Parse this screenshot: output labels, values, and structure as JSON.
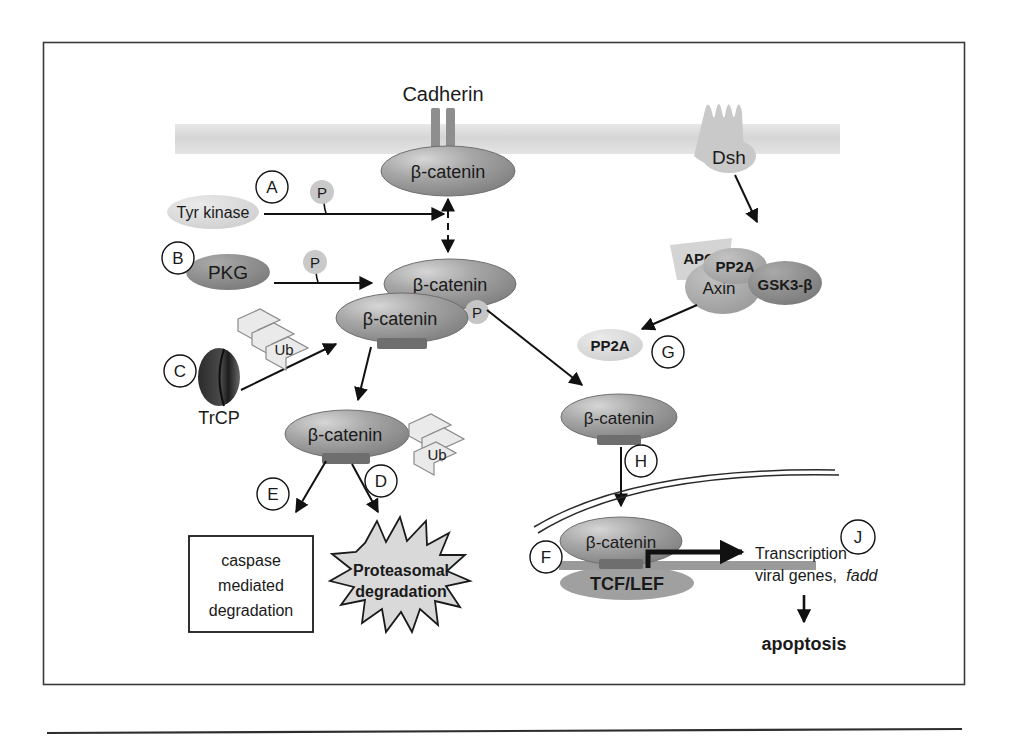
{
  "figure": {
    "frame_border_color": "#3a3a3a",
    "background": "#ffffff"
  },
  "palette": {
    "beta_catenin_fill": "#9a9a9a",
    "beta_catenin_highlight": "#cfcfcf",
    "membrane_band": "#dcdcdc",
    "light_protein": "#d8d8d8",
    "mid_protein": "#a8a8a8",
    "dark_protein": "#8c8c8c",
    "very_dark": "#555555",
    "ub_fill": "#e6e6e6",
    "starburst_fill": "#d9d9d9",
    "dna_bar": "#9a9a9a",
    "tcf_lef_fill": "#a0a0a0",
    "text_dark": "#1a1a1a",
    "text_white": "#ffffff",
    "arrow_black": "#111111"
  },
  "membrane": {
    "label": "",
    "x": 175,
    "y": 124,
    "width": 665,
    "height": 30
  },
  "receptors": {
    "cadherin": {
      "label": "Cadherin",
      "type": "two-bar-transmembrane"
    },
    "dsh": {
      "label": "Dsh",
      "type": "seven-transmembrane-serpentine"
    }
  },
  "proteins": [
    {
      "id": "bcat-membrane",
      "label": "β-catenin",
      "shape": "ellipse",
      "role": "membrane-bound cadherin complex"
    },
    {
      "id": "bcat-cyto-upper",
      "label": "β-catenin",
      "shape": "ellipse",
      "role": "cytoplasmic phosphorylated"
    },
    {
      "id": "bcat-cyto-lower",
      "label": "β-catenin",
      "shape": "ellipse",
      "role": "cytoplasmic ubiquitin-targeted"
    },
    {
      "id": "bcat-ub",
      "label": "β-catenin",
      "shape": "ellipse",
      "role": "ubiquitinated"
    },
    {
      "id": "bcat-nuclear-entry",
      "label": "β-catenin",
      "shape": "ellipse",
      "role": "free cytoplasmic / pre-nuclear"
    },
    {
      "id": "bcat-nucleus",
      "label": "β-catenin",
      "shape": "ellipse",
      "role": "nuclear, bound to TCF/LEF"
    },
    {
      "id": "tyr-kinase",
      "label": "Tyr kinase",
      "shape": "ellipse",
      "role": "kinase"
    },
    {
      "id": "pkg",
      "label": "PKG",
      "shape": "ellipse",
      "role": "kinase"
    },
    {
      "id": "trcp",
      "label": "TrCP",
      "shape": "disc",
      "role": "E3 ligase component"
    },
    {
      "id": "apc",
      "label": "APC",
      "shape": "trapezoid",
      "role": "scaffold"
    },
    {
      "id": "axin",
      "label": "Axin",
      "shape": "ellipse",
      "role": "scaffold"
    },
    {
      "id": "pp2a-complex",
      "label": "PP2A",
      "shape": "ellipse",
      "role": "phosphatase in destruction complex"
    },
    {
      "id": "gsk3b",
      "label": "GSK3-β",
      "shape": "ellipse",
      "role": "kinase"
    },
    {
      "id": "pp2a-free",
      "label": "PP2A",
      "shape": "ellipse",
      "role": "released phosphatase"
    },
    {
      "id": "tcf-lef",
      "label": "TCF/LEF",
      "shape": "ellipse",
      "role": "transcription factor"
    }
  ],
  "phospho_markers": [
    {
      "id": "p-tyr",
      "label": "P"
    },
    {
      "id": "p-pkg",
      "label": "P"
    },
    {
      "id": "p-bcat",
      "label": "P"
    }
  ],
  "ubiquitin_markers": [
    {
      "id": "ub-trcp",
      "label": "Ub"
    },
    {
      "id": "ub-bcat",
      "label": "Ub"
    }
  ],
  "step_labels": [
    {
      "id": "step-a",
      "label": "A"
    },
    {
      "id": "step-b",
      "label": "B"
    },
    {
      "id": "step-c",
      "label": "C"
    },
    {
      "id": "step-d",
      "label": "D"
    },
    {
      "id": "step-e",
      "label": "E"
    },
    {
      "id": "step-f",
      "label": "F"
    },
    {
      "id": "step-g",
      "label": "G"
    },
    {
      "id": "step-h",
      "label": "H"
    },
    {
      "id": "step-j",
      "label": "J"
    }
  ],
  "outcomes": {
    "caspase_box": {
      "line1": "caspase",
      "line2": "mediated",
      "line3": "degradation"
    },
    "proteasome_burst": {
      "line1": "Proteasomal",
      "line2": "degradation"
    },
    "transcription": {
      "line1": "Transcription",
      "line2_plain": "viral genes,",
      "line2_italic": "fadd"
    },
    "apoptosis": {
      "label": "apoptosis"
    }
  }
}
